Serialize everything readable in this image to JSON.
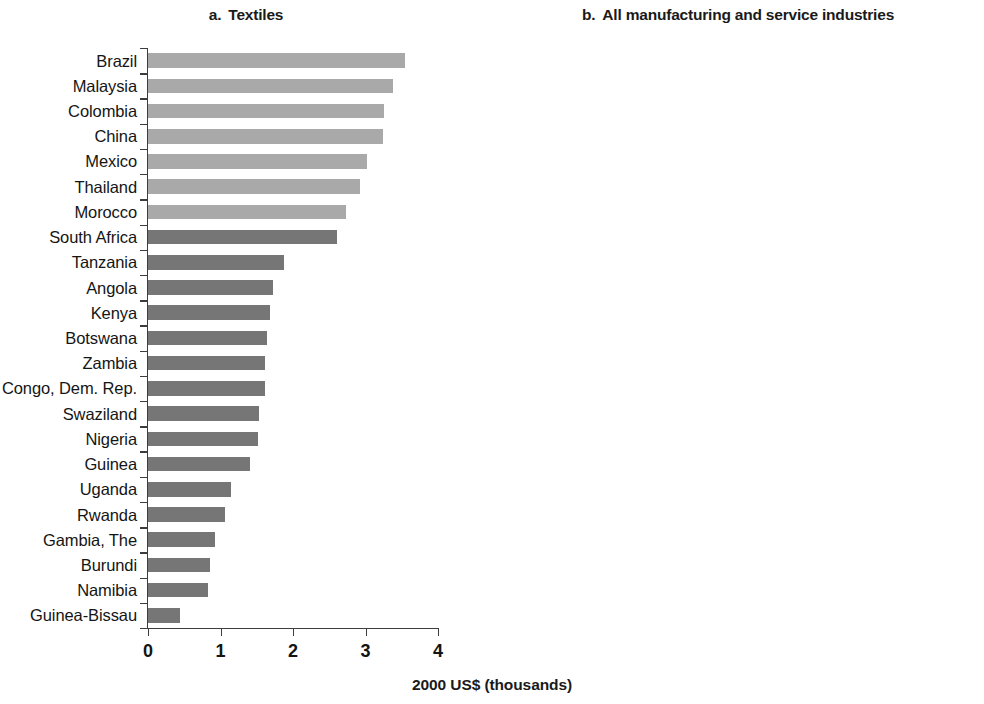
{
  "figure": {
    "axis_caption": "2000 US$ (thousands)",
    "colors": {
      "light_bar": "#a9a9a9",
      "dark_bar": "#767676",
      "axis": "#3d3d3d",
      "text": "#151515",
      "background": "#ffffff"
    }
  },
  "chart_data": [
    {
      "type": "bar",
      "orientation": "horizontal",
      "panel_letter": "a.",
      "title": "Textiles",
      "xlabel": "2000 US$ (thousands)",
      "ylabel": "",
      "xlim": [
        0,
        4
      ],
      "xticks": [
        0,
        1,
        2,
        3,
        4
      ],
      "xticklabels": [
        "0",
        "1",
        "2",
        "3",
        "4"
      ],
      "grid": false,
      "legend": "none",
      "categories": [
        "Brazil",
        "Malaysia",
        "Colombia",
        "China",
        "Mexico",
        "Thailand",
        "Morocco",
        "South Africa",
        "Tanzania",
        "Angola",
        "Kenya",
        "Botswana",
        "Zambia",
        "Congo, Dem. Rep.",
        "Swaziland",
        "Nigeria",
        "Guinea",
        "Uganda",
        "Rwanda",
        "Gambia, The",
        "Burundi",
        "Namibia",
        "Guinea-Bissau"
      ],
      "values": [
        3.54,
        3.38,
        3.26,
        3.24,
        3.02,
        2.93,
        2.73,
        2.6,
        1.87,
        1.72,
        1.68,
        1.64,
        1.62,
        1.61,
        1.53,
        1.52,
        1.41,
        1.15,
        1.06,
        0.93,
        0.85,
        0.83,
        0.44
      ],
      "bar_shades": [
        "light",
        "light",
        "light",
        "light",
        "light",
        "light",
        "light",
        "dark",
        "dark",
        "dark",
        "dark",
        "dark",
        "dark",
        "dark",
        "dark",
        "dark",
        "dark",
        "dark",
        "dark",
        "dark",
        "dark",
        "dark",
        "dark"
      ]
    },
    {
      "type": "bar",
      "orientation": "horizontal",
      "panel_letter": "b.",
      "title": "All manufacturing and service industries",
      "xlabel": "2000 US$ (thousands)",
      "ylabel": "",
      "xlim": [
        0,
        4
      ],
      "xticks": [
        0,
        1,
        2,
        3,
        4
      ],
      "xticklabels": [
        "0",
        "1",
        "2",
        "3",
        "4"
      ],
      "grid": false,
      "legend": "none",
      "categories": [
        "Brazil",
        "Thailand",
        "Malaysia",
        "Chile",
        "South Africa",
        "Morocco",
        "China",
        "Mexico",
        "Colombia",
        "Zambia",
        "Tanzania",
        "Guinea",
        "Kenya",
        "Uganda",
        "Nigeria",
        "Namibia",
        "Angola",
        "Gambia, The",
        "Burundi",
        "Swaziland",
        "Rwanda",
        "Botswana",
        "Congo, Dem. Rep.",
        "Guinea-Bissau"
      ],
      "values": [
        3.62,
        3.14,
        3.13,
        3.04,
        2.96,
        2.88,
        2.42,
        2.11,
        2.0,
        1.54,
        1.18,
        1.08,
        1.04,
        0.8,
        0.78,
        0.62,
        0.58,
        0.52,
        0.5,
        0.42,
        0.4,
        0.38,
        0.2,
        0.06
      ],
      "bar_shades": [
        "light",
        "light",
        "light",
        "light",
        "dark",
        "light",
        "light",
        "light",
        "light",
        "dark",
        "dark",
        "dark",
        "dark",
        "dark",
        "dark",
        "dark",
        "dark",
        "dark",
        "dark",
        "dark",
        "dark",
        "dark",
        "dark",
        "dark"
      ]
    }
  ]
}
